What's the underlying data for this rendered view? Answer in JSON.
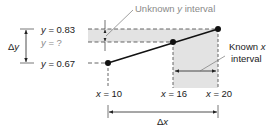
{
  "diagram": {
    "type": "linear-interpolation",
    "points": [
      {
        "x": 10,
        "y": 0.67
      },
      {
        "x": 16,
        "y": null
      },
      {
        "x": 20,
        "y": 0.83
      }
    ],
    "labels": {
      "y_upper": {
        "var": "y",
        "eq": " = 0.83"
      },
      "y_unknown": {
        "var": "y",
        "eq": " = ?"
      },
      "y_lower": {
        "var": "y",
        "eq": " = 0.67"
      },
      "delta_y": {
        "sym": "Δ",
        "var": "y"
      },
      "delta_x": {
        "sym": "Δ",
        "var": "x"
      },
      "x_left": {
        "var": "x",
        "eq": " = 10"
      },
      "x_mid": {
        "var": "x",
        "eq": " = 16"
      },
      "x_right": {
        "var": "x",
        "eq": " = 20"
      },
      "unknown_y_interval": {
        "pre": "Unknown ",
        "var": "y",
        "post": " interval"
      },
      "known_x_interval": {
        "line1_pre": "Known ",
        "line1_var": "x",
        "line2": "interval"
      }
    },
    "colors": {
      "shade": "#e3e3e3",
      "line": "#111111",
      "dash": "#555555",
      "grey_text": "#8a8a8a"
    }
  }
}
